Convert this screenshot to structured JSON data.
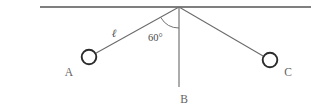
{
  "figure": {
    "background_color": "#ffffff",
    "width": 321,
    "height": 109
  },
  "colors": {
    "ceiling": "#555555",
    "string": "#6b6b6b",
    "vertical": "#7a7a7a",
    "arc": "#6b6b6b",
    "bob_outline": "#2b2b2b",
    "bob_fill": "#ffffff",
    "text": "#5a5a5a"
  },
  "labels": {
    "bob_a": "A",
    "bob_c": "C",
    "rest_b": "B",
    "angle": "60°",
    "length": "ℓ"
  },
  "geometry": {
    "ceiling_y": 7,
    "ceiling_x_start": 40,
    "ceiling_x_end": 311,
    "pivot_x": 179,
    "pivot_y": 7,
    "bob_a_cx": 89,
    "bob_a_cy": 57,
    "bob_c_cx": 270,
    "bob_c_cy": 60,
    "bob_radius": 7.3,
    "rest_line_end_y": 87,
    "arc_radius": 21,
    "angle_degrees": 60
  }
}
